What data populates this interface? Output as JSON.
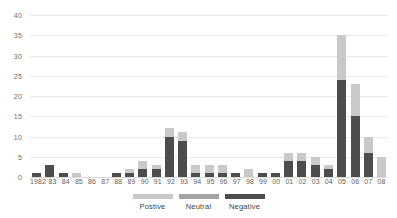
{
  "chart_data": {
    "type": "bar",
    "subtype": "stacked-vertical",
    "title": "",
    "subtitle": "",
    "xlabel": "",
    "ylabel": "",
    "ylim": [
      0,
      40
    ],
    "ytick_step": 5,
    "yticks": [
      "40",
      "35",
      "30",
      "25",
      "20",
      "15",
      "10",
      "5",
      "0"
    ],
    "grid": true,
    "grid_axis": "y",
    "legend_position": "bottom-center",
    "categories": [
      "1982",
      "83",
      "84",
      "85",
      "86",
      "87",
      "88",
      "89",
      "90",
      "91",
      "92",
      "93",
      "94",
      "95",
      "96",
      "97",
      "98",
      "99",
      "00",
      "01",
      "02",
      "03",
      "04",
      "05",
      "06",
      "07",
      "08"
    ],
    "series": [
      {
        "name": "Postive",
        "color": "#c9c9c9",
        "values": [
          0,
          0,
          0,
          1,
          0,
          0,
          0,
          1,
          2,
          1,
          2,
          2,
          2,
          2,
          2,
          0,
          2,
          0,
          0,
          2,
          2,
          2,
          1,
          11,
          8,
          4,
          5
        ]
      },
      {
        "name": "Neutral",
        "color": "#a3a3a3",
        "values": [
          0,
          0,
          0,
          0,
          0,
          0,
          0,
          0,
          0,
          0,
          0,
          0,
          0,
          0,
          0,
          0,
          0,
          0,
          0,
          0,
          0,
          0,
          0,
          0,
          0,
          0,
          0
        ]
      },
      {
        "name": "Negative",
        "color": "#4d4d4d",
        "values": [
          1,
          3,
          1,
          0,
          0,
          0,
          1,
          1,
          2,
          2,
          10,
          9,
          1,
          1,
          1,
          1,
          0,
          1,
          1,
          4,
          4,
          3,
          2,
          24,
          15,
          6,
          0
        ]
      }
    ],
    "totals": [
      1,
      3,
      1,
      1,
      0,
      0,
      1,
      2,
      4,
      3,
      12,
      11,
      3,
      3,
      3,
      1,
      2,
      1,
      1,
      6,
      6,
      5,
      3,
      35,
      23,
      10,
      5
    ]
  },
  "legend": {
    "items": [
      {
        "label": "Postive",
        "color": "#c9c9c9"
      },
      {
        "label": "Neutral",
        "color": "#a3a3a3"
      },
      {
        "label": "Negative",
        "color": "#4d4d4d"
      }
    ]
  },
  "colors": {
    "background": "#ffffff",
    "gridline": "#e9e9e9",
    "baseline": "#d9d9d9",
    "tick_text": "#6e6e6e",
    "label_text": "#5f5f5f",
    "legend_text": "#3f3f3f"
  }
}
